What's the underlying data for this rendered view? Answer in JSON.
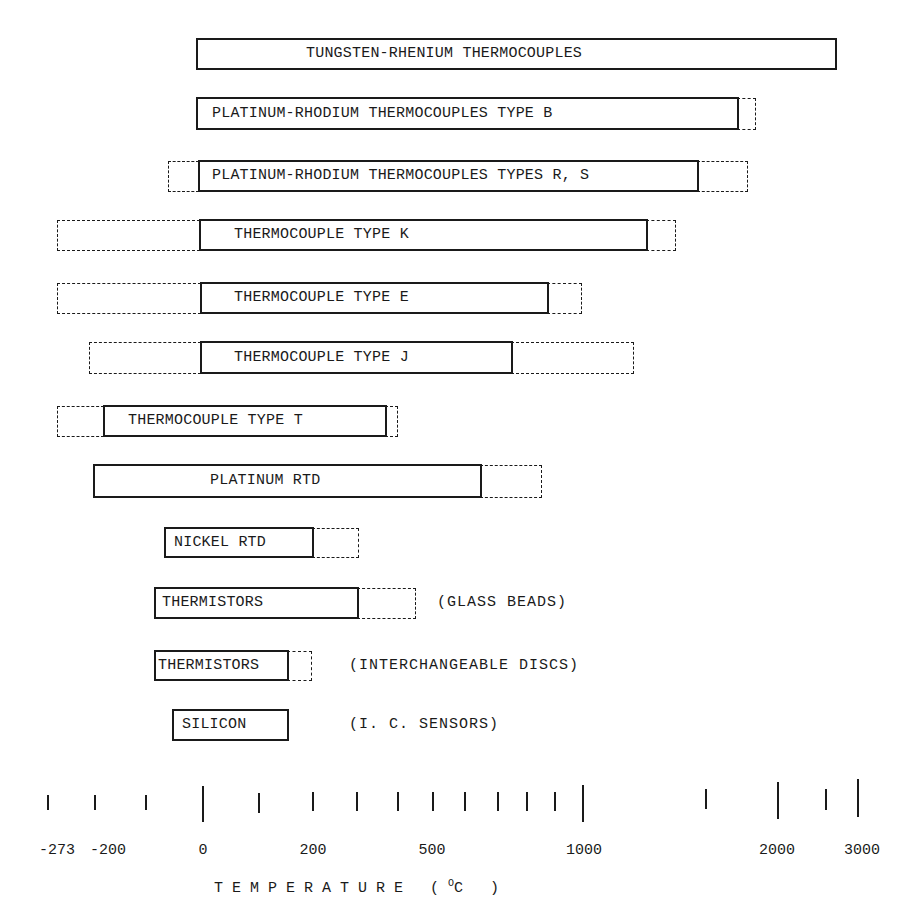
{
  "chart_data": {
    "type": "range-bar",
    "title": "",
    "xlabel": "TEMPERATURE (°C)",
    "ylabel": "",
    "scale": "nonlinear (compressed above 1000 °C)",
    "grid": false,
    "legend": "none; solid box = normal range, dashed box = extended/limited range",
    "x_ticks": [
      -273,
      -200,
      -100,
      0,
      100,
      200,
      300,
      400,
      500,
      600,
      700,
      800,
      900,
      1000,
      1500,
      2000,
      2500,
      3000
    ],
    "x_tick_labels": [
      "-273",
      "-200",
      "",
      "0",
      "",
      "200",
      "",
      "",
      "500",
      "",
      "",
      "",
      "",
      "1000",
      "",
      "2000",
      "",
      "3000"
    ],
    "series": [
      {
        "name": "TUNGSTEN-RHENIUM THERMOCOUPLES",
        "note": "",
        "solid": [
          -10,
          2800
        ],
        "dashed": null
      },
      {
        "name": "PLATINUM-RHODIUM THERMOCOUPLES TYPE B",
        "note": "",
        "solid": [
          -10,
          1700
        ],
        "dashed": [
          1700,
          1820
        ]
      },
      {
        "name": "PLATINUM-RHODIUM THERMOCOUPLES TYPES R, S",
        "note": "",
        "solid": [
          -10,
          1400
        ],
        "dashed_low": [
          -50,
          -10
        ],
        "dashed_high": [
          1400,
          1760
        ]
      },
      {
        "name": "THERMOCOUPLE TYPE K",
        "note": "",
        "solid": [
          0,
          1150
        ],
        "dashed_low": [
          -270,
          0
        ],
        "dashed_high": [
          1150,
          1370
        ]
      },
      {
        "name": "THERMOCOUPLE TYPE E",
        "note": "",
        "solid": [
          0,
          850
        ],
        "dashed_low": [
          -270,
          0
        ],
        "dashed_high": [
          850,
          1000
        ]
      },
      {
        "name": "THERMOCOUPLE TYPE J",
        "note": "",
        "solid": [
          0,
          750
        ],
        "dashed_low": [
          -210,
          0
        ],
        "dashed_high": [
          750,
          1200
        ]
      },
      {
        "name": "THERMOCOUPLE TYPE T",
        "note": "",
        "solid": [
          -200,
          350
        ],
        "dashed_low": [
          -270,
          -200
        ],
        "dashed_high": [
          350,
          400
        ]
      },
      {
        "name": "PLATINUM RTD",
        "note": "",
        "solid": [
          -220,
          650
        ],
        "dashed_high": [
          650,
          850
        ]
      },
      {
        "name": "NICKEL RTD",
        "note": "",
        "solid": [
          -80,
          200
        ],
        "dashed_high": [
          200,
          300
        ]
      },
      {
        "name": "THERMISTORS",
        "note": "(GLASS BEADS)",
        "solid": [
          -100,
          300
        ],
        "dashed_high": [
          300,
          450
        ]
      },
      {
        "name": "THERMISTORS",
        "note": "(INTERCHANGEABLE DISCS)",
        "solid": [
          -100,
          150
        ],
        "dashed_high": [
          150,
          200
        ]
      },
      {
        "name": "SILICON",
        "note": "(I. C. SENSORS)",
        "solid": [
          -55,
          150
        ]
      }
    ]
  },
  "layout": {
    "bars": [
      {
        "label_left": 306,
        "top": 38,
        "h": 32,
        "solid": [
          196,
          837
        ],
        "dashed": []
      },
      {
        "label_left": 212,
        "top": 97,
        "h": 33,
        "solid": [
          196,
          739
        ],
        "dashed": [
          [
            737,
            756
          ]
        ]
      },
      {
        "label_left": 212,
        "top": 160,
        "h": 32,
        "solid": [
          198,
          699
        ],
        "dashed": [
          [
            168,
            199
          ],
          [
            697,
            748
          ]
        ]
      },
      {
        "label_left": 234,
        "top": 219,
        "h": 32,
        "solid": [
          199,
          648
        ],
        "dashed": [
          [
            57,
            200
          ],
          [
            646,
            676
          ]
        ]
      },
      {
        "label_left": 234,
        "top": 282,
        "h": 32,
        "solid": [
          200,
          549
        ],
        "dashed": [
          [
            57,
            201
          ],
          [
            547,
            582
          ]
        ]
      },
      {
        "label_left": 234,
        "top": 341,
        "h": 33,
        "solid": [
          200,
          513
        ],
        "dashed": [
          [
            89,
            201
          ],
          [
            511,
            634
          ]
        ]
      },
      {
        "label_left": 128,
        "top": 405,
        "h": 32,
        "solid": [
          103,
          387
        ],
        "dashed": [
          [
            57,
            104
          ],
          [
            385,
            398
          ]
        ]
      },
      {
        "label_left": 210,
        "top": 464,
        "h": 34,
        "solid": [
          93,
          482
        ],
        "dashed": [
          [
            480,
            542
          ]
        ]
      },
      {
        "label_left": 174,
        "top": 527,
        "h": 31,
        "solid": [
          164,
          314
        ],
        "dashed": [
          [
            312,
            359
          ]
        ]
      },
      {
        "label_left": 162,
        "top": 587,
        "h": 32,
        "solid": [
          154,
          359
        ],
        "dashed": [
          [
            357,
            416
          ]
        ],
        "note_left": 437
      },
      {
        "label_left": 158,
        "top": 650,
        "h": 31,
        "solid": [
          154,
          289
        ],
        "dashed": [
          [
            287,
            312
          ]
        ],
        "note_left": 349
      },
      {
        "label_left": 182,
        "top": 709,
        "h": 32,
        "solid": [
          172,
          289
        ],
        "dashed": [],
        "note_left": 349
      }
    ],
    "ticks": [
      {
        "x": 48,
        "top": 795,
        "h": 15
      },
      {
        "x": 95,
        "top": 795,
        "h": 15
      },
      {
        "x": 146,
        "top": 795,
        "h": 15
      },
      {
        "x": 203,
        "top": 786,
        "h": 36
      },
      {
        "x": 259,
        "top": 793,
        "h": 20
      },
      {
        "x": 313,
        "top": 792,
        "h": 19
      },
      {
        "x": 357,
        "top": 792,
        "h": 19
      },
      {
        "x": 398,
        "top": 792,
        "h": 19
      },
      {
        "x": 433,
        "top": 792,
        "h": 19
      },
      {
        "x": 465,
        "top": 792,
        "h": 19
      },
      {
        "x": 498,
        "top": 792,
        "h": 19
      },
      {
        "x": 527,
        "top": 792,
        "h": 19
      },
      {
        "x": 555,
        "top": 792,
        "h": 19
      },
      {
        "x": 583,
        "top": 785,
        "h": 37
      },
      {
        "x": 706,
        "top": 789,
        "h": 20
      },
      {
        "x": 778,
        "top": 782,
        "h": 37
      },
      {
        "x": 826,
        "top": 789,
        "h": 21
      },
      {
        "x": 858,
        "top": 779,
        "h": 38
      }
    ],
    "tick_labels": [
      {
        "x": 57,
        "text": "-273"
      },
      {
        "x": 108,
        "text": "-200"
      },
      {
        "x": 203,
        "text": "0"
      },
      {
        "x": 313,
        "text": "200"
      },
      {
        "x": 432,
        "text": "500"
      },
      {
        "x": 584,
        "text": "1000"
      },
      {
        "x": 777,
        "text": "2000"
      },
      {
        "x": 862,
        "text": "3000"
      }
    ]
  },
  "axis": {
    "title_prefix": "TEMPERATURE (",
    "title_deg": "O",
    "title_unit": "C )"
  }
}
